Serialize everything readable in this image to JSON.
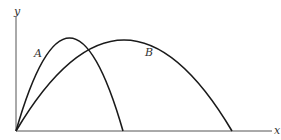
{
  "diagram": {
    "type": "projectile-trajectories",
    "axes": {
      "x_label": "x",
      "y_label": "y",
      "origin_px": [
        16,
        131
      ]
    },
    "curves": [
      {
        "label": "A",
        "start_px": [
          16,
          131
        ],
        "peak_px": [
          69,
          38
        ],
        "end_px": [
          123,
          131
        ]
      },
      {
        "label": "B",
        "start_px": [
          16,
          131
        ],
        "peak_px": [
          124,
          40
        ],
        "end_px": [
          232,
          131
        ]
      }
    ],
    "colors": {
      "curve": "#1a1a1a",
      "axis": "#555555",
      "label": "#333333",
      "background": "#ffffff"
    }
  }
}
